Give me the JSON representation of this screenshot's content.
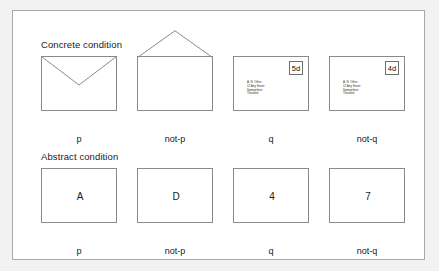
{
  "figure": {
    "background_color": "#f2f2f2",
    "panel_background": "#ffffff",
    "border_color": "#a8a8a8",
    "line_color": "#8a8a8a"
  },
  "sections": [
    {
      "heading": "Concrete condition",
      "items": [
        {
          "label": "p",
          "kind": "envelope",
          "flap": "closed",
          "stamp": null,
          "address": []
        },
        {
          "label": "not-p",
          "kind": "envelope",
          "flap": "open",
          "stamp": null,
          "address": []
        },
        {
          "label": "q",
          "kind": "envelope",
          "flap": "none",
          "stamp": "5d",
          "address": [
            "A. N. Other",
            "12 Any Street",
            "Somewhere",
            "Thisshire"
          ]
        },
        {
          "label": "not-q",
          "kind": "envelope",
          "flap": "none",
          "stamp": "4d",
          "address": [
            "A. N. Other",
            "12 Any Street",
            "Somewhere",
            "Thisshire"
          ]
        }
      ]
    },
    {
      "heading": "Abstract condition",
      "items": [
        {
          "label": "p",
          "kind": "card",
          "face": "A"
        },
        {
          "label": "not-p",
          "kind": "card",
          "face": "D"
        },
        {
          "label": "q",
          "kind": "card",
          "face": "4"
        },
        {
          "label": "not-q",
          "kind": "card",
          "face": "7"
        }
      ]
    }
  ]
}
